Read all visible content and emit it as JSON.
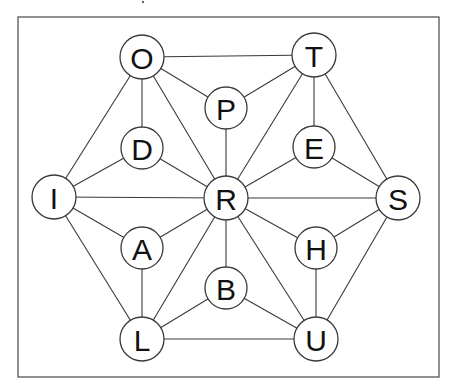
{
  "diagram": {
    "type": "letter-graph",
    "frame": {
      "x": 18,
      "y": 17,
      "width": 421,
      "height": 360
    },
    "nodes": [
      {
        "id": "O",
        "label": "O",
        "x": 142,
        "y": 57,
        "r": 22
      },
      {
        "id": "T",
        "label": "T",
        "x": 314,
        "y": 55,
        "r": 22
      },
      {
        "id": "P",
        "label": "P",
        "x": 226,
        "y": 108,
        "r": 21
      },
      {
        "id": "D",
        "label": "D",
        "x": 142,
        "y": 148,
        "r": 21
      },
      {
        "id": "E",
        "label": "E",
        "x": 314,
        "y": 147,
        "r": 21
      },
      {
        "id": "I",
        "label": "I",
        "x": 54,
        "y": 197,
        "r": 22
      },
      {
        "id": "R",
        "label": "R",
        "x": 226,
        "y": 198,
        "r": 22
      },
      {
        "id": "S",
        "label": "S",
        "x": 398,
        "y": 198,
        "r": 22
      },
      {
        "id": "A",
        "label": "A",
        "x": 142,
        "y": 248,
        "r": 21
      },
      {
        "id": "H",
        "label": "H",
        "x": 316,
        "y": 248,
        "r": 21
      },
      {
        "id": "B",
        "label": "B",
        "x": 226,
        "y": 288,
        "r": 21
      },
      {
        "id": "L",
        "label": "L",
        "x": 142,
        "y": 339,
        "r": 22
      },
      {
        "id": "U",
        "label": "U",
        "x": 316,
        "y": 339,
        "r": 22
      }
    ],
    "edges": [
      [
        "O",
        "T"
      ],
      [
        "O",
        "P"
      ],
      [
        "O",
        "D"
      ],
      [
        "O",
        "I"
      ],
      [
        "O",
        "R"
      ],
      [
        "P",
        "T"
      ],
      [
        "P",
        "R"
      ],
      [
        "T",
        "R"
      ],
      [
        "T",
        "E"
      ],
      [
        "T",
        "S"
      ],
      [
        "E",
        "R"
      ],
      [
        "E",
        "S"
      ],
      [
        "D",
        "I"
      ],
      [
        "D",
        "R"
      ],
      [
        "I",
        "R"
      ],
      [
        "I",
        "A"
      ],
      [
        "I",
        "L"
      ],
      [
        "A",
        "R"
      ],
      [
        "A",
        "L"
      ],
      [
        "R",
        "S"
      ],
      [
        "R",
        "H"
      ],
      [
        "R",
        "B"
      ],
      [
        "R",
        "L"
      ],
      [
        "R",
        "U"
      ],
      [
        "S",
        "H"
      ],
      [
        "S",
        "U"
      ],
      [
        "H",
        "U"
      ],
      [
        "B",
        "L"
      ],
      [
        "B",
        "U"
      ],
      [
        "L",
        "U"
      ]
    ]
  }
}
